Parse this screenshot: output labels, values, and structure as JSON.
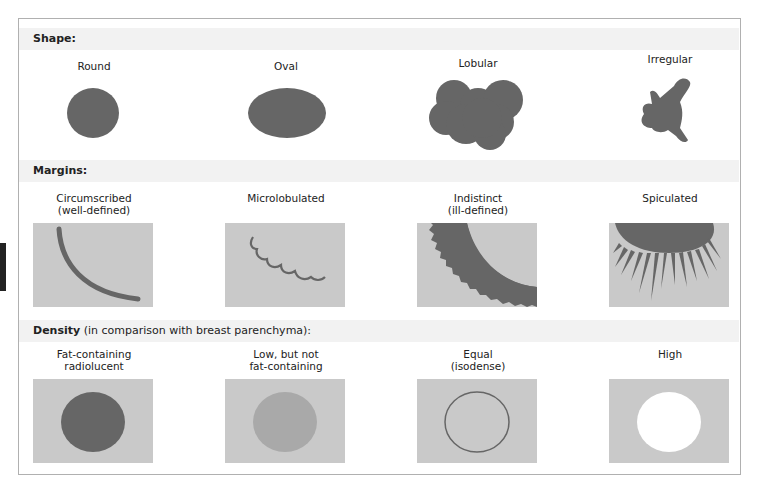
{
  "sections": {
    "shape": {
      "heading_bold": "Shape:",
      "heading_rest": "",
      "items": [
        {
          "label": "Round",
          "icon": "round-mass-icon"
        },
        {
          "label": "Oval",
          "icon": "oval-mass-icon"
        },
        {
          "label": "Lobular",
          "icon": "lobular-mass-icon"
        },
        {
          "label": "Irregular",
          "icon": "irregular-mass-icon"
        }
      ]
    },
    "margins": {
      "heading_bold": "Margins:",
      "heading_rest": "",
      "items": [
        {
          "label_line1": "Circumscribed",
          "label_line2": "(well-defined)",
          "icon": "circumscribed-margin-icon"
        },
        {
          "label_line1": "Microlobulated",
          "label_line2": "",
          "icon": "microlobulated-margin-icon"
        },
        {
          "label_line1": "Indistinct",
          "label_line2": "(ill-defined)",
          "icon": "indistinct-margin-icon"
        },
        {
          "label_line1": "Spiculated",
          "label_line2": "",
          "icon": "spiculated-margin-icon"
        }
      ]
    },
    "density": {
      "heading_bold": "Density",
      "heading_rest": " (in comparison with breast parenchyma):",
      "items": [
        {
          "label_line1": "Fat-containing",
          "label_line2": "radiolucent",
          "icon": "fat-density-icon"
        },
        {
          "label_line1": "Low, but not",
          "label_line2": "fat-containing",
          "icon": "low-density-icon"
        },
        {
          "label_line1": "Equal",
          "label_line2": "(isodense)",
          "icon": "equal-density-icon"
        },
        {
          "label_line1": "High",
          "label_line2": "",
          "icon": "high-density-icon"
        }
      ]
    }
  },
  "colors": {
    "mass": "#666666",
    "tile_bg": "#c9c9c9",
    "low_density": "#a9a9a9",
    "header_bg": "#f2f2f2",
    "border": "#b0b0b0"
  }
}
